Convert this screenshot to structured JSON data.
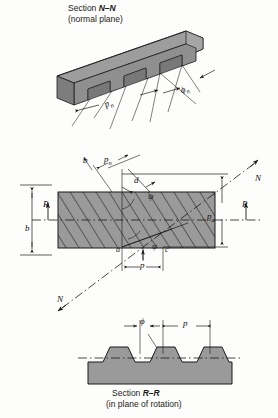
{
  "figure": {
    "background_color": "#fdfdfb",
    "metal_fill": "#9a9a9a",
    "metal_fill_dark": "#808080",
    "metal_fill_light": "#b4b4b4",
    "line_color": "#1a1a1a"
  },
  "top_view": {
    "caption_line1": "Section N–N",
    "caption_line2": "(normal plane)",
    "caption_section_word": "Section",
    "caption_section_id": "N–N",
    "labels": {
      "normal_pitch": "p",
      "normal_pitch_sub": "n",
      "pressure_angle": "ϕ",
      "pressure_angle_sub": "n"
    }
  },
  "middle_view": {
    "labels": {
      "face_width_left": "b",
      "face_width_top": "b",
      "normal_pitch": "p",
      "normal_pitch_sub": "n",
      "tooth_thickness": "d",
      "helix_angle": "ψ",
      "helix_angle_inner": "ψ",
      "axial_pitch": "p",
      "axial_pitch_sub": "a",
      "circular_pitch": "p",
      "rotation_axis_left": "R",
      "rotation_axis_right": "R",
      "normal_axis_upper": "N",
      "normal_axis_lower": "N",
      "point_a": "a",
      "point_c": "c"
    }
  },
  "bottom_view": {
    "caption_line1": "Section R–R",
    "caption_line2": "(in plane of rotation)",
    "caption_section_word": "Section",
    "caption_section_id": "R–R",
    "labels": {
      "pressure_angle": "ϕ",
      "circular_pitch": "p"
    }
  }
}
